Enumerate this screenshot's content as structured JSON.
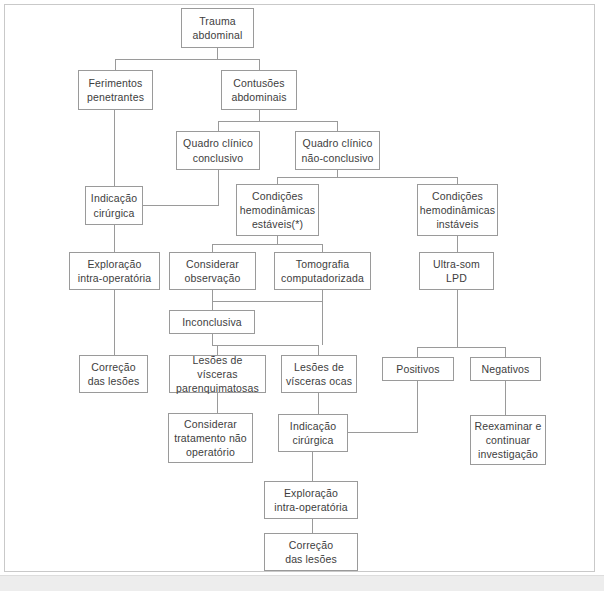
{
  "figure": {
    "kind": "flowchart",
    "language": "pt-BR",
    "border_color": "#c9c9c9",
    "node_border_color": "#9a9a9a",
    "text_color": "#3d3d3d",
    "background": "#ffffff"
  },
  "nodes": [
    {
      "id": "trauma",
      "label": "Trauma\nabdominal",
      "x": 181,
      "y": 8,
      "w": 73,
      "h": 40
    },
    {
      "id": "ferimentos",
      "label": "Ferimentos\npenetrantes",
      "x": 78,
      "y": 70,
      "w": 75,
      "h": 40
    },
    {
      "id": "contusoes",
      "label": "Contusões\nabdominais",
      "x": 221,
      "y": 70,
      "w": 76,
      "h": 40
    },
    {
      "id": "quadro-conclusivo",
      "label": "Quadro clínico\nconclusivo",
      "x": 176,
      "y": 131,
      "w": 84,
      "h": 39
    },
    {
      "id": "quadro-nao",
      "label": "Quadro clínico\nnão-conclusivo",
      "x": 295,
      "y": 131,
      "w": 85,
      "h": 39
    },
    {
      "id": "indicacao-1",
      "label": "Indicação\ncirúrgica",
      "x": 85,
      "y": 186,
      "w": 58,
      "h": 39
    },
    {
      "id": "cond-estaveis",
      "label": "Condições\nhemodinâmicas\nestáveis(*)",
      "x": 236,
      "y": 184,
      "w": 83,
      "h": 52
    },
    {
      "id": "cond-instaveis",
      "label": "Condições\nhemodinâmicas\ninstáveis",
      "x": 417,
      "y": 184,
      "w": 81,
      "h": 52
    },
    {
      "id": "exploracao-1",
      "label": "Exploração\nintra-operatória",
      "x": 69,
      "y": 252,
      "w": 91,
      "h": 38
    },
    {
      "id": "considerar-obs",
      "label": "Considerar\nobservação",
      "x": 169,
      "y": 252,
      "w": 87,
      "h": 38
    },
    {
      "id": "tomografia",
      "label": "Tomografia\ncomputadorizada",
      "x": 274,
      "y": 252,
      "w": 97,
      "h": 38
    },
    {
      "id": "ultrassom",
      "label": "Ultra-som\nLPD",
      "x": 419,
      "y": 252,
      "w": 75,
      "h": 38
    },
    {
      "id": "inconclusiva",
      "label": "Inconclusiva",
      "x": 169,
      "y": 310,
      "w": 86,
      "h": 24
    },
    {
      "id": "correcao-1",
      "label": "Correção\ndas lesões",
      "x": 79,
      "y": 355,
      "w": 69,
      "h": 38
    },
    {
      "id": "lesoes-parenq",
      "label": "Lesões de vísceras\nparenquimatosas",
      "x": 169,
      "y": 355,
      "w": 97,
      "h": 38
    },
    {
      "id": "lesoes-ocas",
      "label": "Lesões de\nvísceras ocas",
      "x": 281,
      "y": 355,
      "w": 76,
      "h": 38
    },
    {
      "id": "positivos",
      "label": "Positivos",
      "x": 382,
      "y": 357,
      "w": 72,
      "h": 24
    },
    {
      "id": "negativos",
      "label": "Negativos",
      "x": 470,
      "y": 357,
      "w": 71,
      "h": 24
    },
    {
      "id": "considerar-trat",
      "label": "Considerar\ntratamento não\noperatório",
      "x": 168,
      "y": 413,
      "w": 85,
      "h": 50
    },
    {
      "id": "indicacao-2",
      "label": "Indicação\ncirúrgica",
      "x": 278,
      "y": 414,
      "w": 70,
      "h": 38
    },
    {
      "id": "reexaminar",
      "label": "Reexaminar e\ncontinuar\ninvestigação",
      "x": 470,
      "y": 415,
      "w": 76,
      "h": 50
    },
    {
      "id": "exploracao-2",
      "label": "Exploração\nintra-operatória",
      "x": 264,
      "y": 481,
      "w": 94,
      "h": 38
    },
    {
      "id": "correcao-2",
      "label": "Correção\ndas lesões",
      "x": 264,
      "y": 533,
      "w": 94,
      "h": 38
    }
  ],
  "edges": [
    {
      "from": "trauma",
      "to": "ferimentos",
      "d": "M 217.5 48 L 217.5 59 L 115.5 59 L 115.5 70"
    },
    {
      "from": "trauma",
      "to": "contusoes",
      "d": "M 217.5 48 L 217.5 59 L 259.5 59 L 259.5 70"
    },
    {
      "from": "contusoes",
      "to": "quadro-conclusivo",
      "d": "M 259.5 110 L 259.5 121 L 218.5 121 L 218.5 131"
    },
    {
      "from": "contusoes",
      "to": "quadro-nao",
      "d": "M 259.5 110 L 259.5 121 L 337.5 121 L 337.5 131"
    },
    {
      "from": "quadro-conclusivo",
      "to": "indicacao-1",
      "d": "M 218.5 170 L 218.5 205.5 L 143 205.5"
    },
    {
      "from": "quadro-nao",
      "to": "cond-estaveis",
      "d": "M 337.5 170 L 337.5 177 L 277.5 177 L 277.5 184"
    },
    {
      "from": "quadro-nao",
      "to": "cond-instaveis",
      "d": "M 337.5 177 L 457.5 177 L 457.5 184"
    },
    {
      "from": "ferimentos",
      "to": "indicacao-1",
      "d": "M 114.5 110 L 114.5 186"
    },
    {
      "from": "indicacao-1",
      "to": "exploracao-1",
      "d": "M 114.5 225 L 114.5 252"
    },
    {
      "from": "cond-estaveis",
      "to": "considerar-obs",
      "d": "M 277.5 236 L 277.5 244 L 212.5 244 L 212.5 252"
    },
    {
      "from": "cond-estaveis",
      "to": "tomografia",
      "d": "M 277.5 244 L 322.5 244 L 322.5 252"
    },
    {
      "from": "cond-instaveis",
      "to": "ultrassom",
      "d": "M 457.5 236 L 457.5 252"
    },
    {
      "from": "considerar-obs",
      "to": "inconclusiva",
      "d": "M 212.5 290 L 212.5 310"
    },
    {
      "from": "tomografia",
      "to": "inconclusiva",
      "d": "M 322.5 290 L 322.5 301 L 212.5 301"
    },
    {
      "from": "exploracao-1",
      "to": "correcao-1",
      "d": "M 114.5 290 L 114.5 355"
    },
    {
      "from": "inconclusiva",
      "to": "lesoes-parenq",
      "d": "M 212.5 334 L 212.5 345 L 217.5 345 L 217.5 355"
    },
    {
      "from": "inconclusiva",
      "to": "lesoes-ocas",
      "d": "M 217.5 345 L 318.5 345 L 318.5 355"
    },
    {
      "from": "tomografia",
      "to": "lesoes-ocas",
      "d": "M 322.5 301 L 322.5 345"
    },
    {
      "from": "ultrassom",
      "to": "positivos",
      "d": "M 457.5 290 L 457.5 347 L 417.5 347 L 417.5 357"
    },
    {
      "from": "ultrassom",
      "to": "negativos",
      "d": "M 457.5 347 L 505.5 347 L 505.5 357"
    },
    {
      "from": "lesoes-parenq",
      "to": "considerar-trat",
      "d": "M 217.5 393 L 217.5 413"
    },
    {
      "from": "lesoes-ocas",
      "to": "indicacao-2",
      "d": "M 318.5 393 L 318.5 414"
    },
    {
      "from": "positivos",
      "to": "indicacao-2",
      "d": "M 417.5 381 L 417.5 432.5 L 348 432.5"
    },
    {
      "from": "negativos",
      "to": "reexaminar",
      "d": "M 505.5 381 L 505.5 415"
    },
    {
      "from": "indicacao-2",
      "to": "exploracao-2",
      "d": "M 312.5 452 L 312.5 481"
    },
    {
      "from": "exploracao-2",
      "to": "correcao-2",
      "d": "M 312.5 519 L 312.5 533"
    }
  ]
}
